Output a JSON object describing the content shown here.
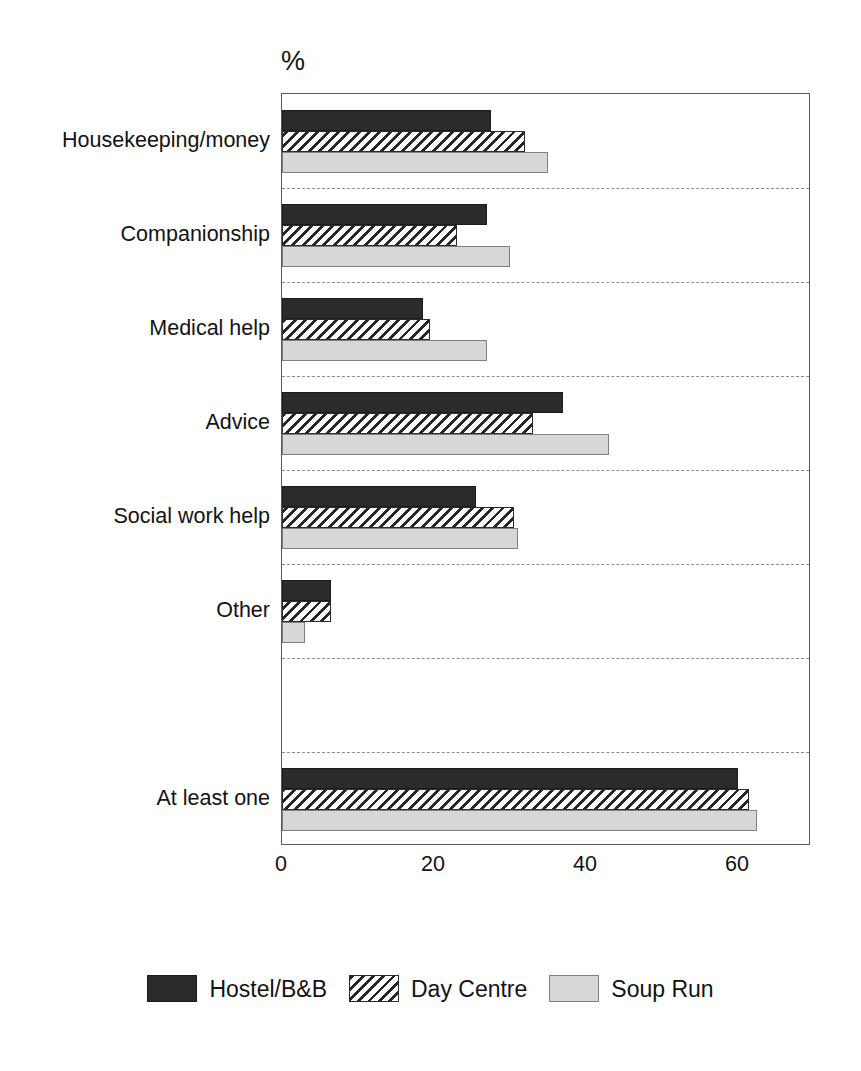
{
  "chart_data": {
    "type": "bar",
    "orientation": "horizontal",
    "title": "",
    "unit_label": "%",
    "xlabel": "",
    "ylabel": "",
    "xlim": [
      0,
      65
    ],
    "xticks": [
      0,
      20,
      40,
      60
    ],
    "xtick_labels": [
      "0",
      "20",
      "40",
      "60"
    ],
    "grid": true,
    "grid_axis": "y",
    "legend_position": "bottom",
    "categories": [
      "Housekeeping/money",
      "Companionship",
      "Medical help",
      "Advice",
      "Social work help",
      "Other",
      "",
      "At least one"
    ],
    "series": [
      {
        "name": "Hostel/B&B",
        "color": "#2b2b2b",
        "pattern": "solid-dark",
        "values": [
          27.5,
          27,
          18.5,
          37,
          25.5,
          6.5,
          null,
          60
        ]
      },
      {
        "name": "Day Centre",
        "color": "#ffffff",
        "pattern": "diagonal-hatch",
        "values": [
          32,
          23,
          19.5,
          33,
          30.5,
          6.5,
          null,
          61.5
        ]
      },
      {
        "name": "Soup Run",
        "color": "#d7d7d7",
        "pattern": "solid-light",
        "values": [
          35,
          30,
          27,
          43,
          31,
          3,
          null,
          62.5
        ]
      }
    ]
  },
  "legend": {
    "items": [
      {
        "label": "Hostel/B&B"
      },
      {
        "label": "Day Centre"
      },
      {
        "label": "Soup Run"
      }
    ]
  }
}
